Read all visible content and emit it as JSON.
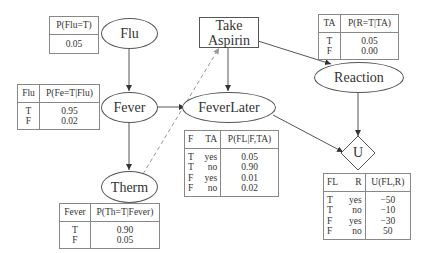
{
  "nodes": {
    "flu": {
      "label": "Flu",
      "shape": "ellipse"
    },
    "fever": {
      "label": "Fever",
      "shape": "ellipse"
    },
    "therm": {
      "label": "Therm",
      "shape": "ellipse"
    },
    "take_aspirin": {
      "label_line1": "Take",
      "label_line2": "Aspirin",
      "shape": "rectangle"
    },
    "fever_later": {
      "label": "FeverLater",
      "shape": "ellipse"
    },
    "reaction": {
      "label": "Reaction",
      "shape": "ellipse"
    },
    "utility": {
      "label": "U",
      "shape": "diamond"
    }
  },
  "edges": [
    {
      "from": "Flu",
      "to": "Fever",
      "style": "solid"
    },
    {
      "from": "Fever",
      "to": "FeverLater",
      "style": "solid"
    },
    {
      "from": "Fever",
      "to": "Therm",
      "style": "solid"
    },
    {
      "from": "Therm",
      "to": "Take Aspirin",
      "style": "dashed"
    },
    {
      "from": "Take Aspirin",
      "to": "FeverLater",
      "style": "solid"
    },
    {
      "from": "Take Aspirin",
      "to": "Reaction",
      "style": "solid"
    },
    {
      "from": "FeverLater",
      "to": "U",
      "style": "solid"
    },
    {
      "from": "Reaction",
      "to": "U",
      "style": "solid"
    }
  ],
  "tables": {
    "flu": {
      "header": [
        "P(Flu=T)"
      ],
      "rows": [
        [
          "0.05"
        ]
      ]
    },
    "fever": {
      "header": [
        "Flu",
        "P(Fe=T|Flu)"
      ],
      "rows": [
        [
          "T",
          "0.95"
        ],
        [
          "F",
          "0.02"
        ]
      ]
    },
    "therm": {
      "header": [
        "Fever",
        "P(Th=T|Fever)"
      ],
      "rows": [
        [
          "T",
          "0.90"
        ],
        [
          "F",
          "0.05"
        ]
      ]
    },
    "reaction": {
      "header": [
        "TA",
        "P(R=T|TA)"
      ],
      "rows": [
        [
          "T",
          "0.05"
        ],
        [
          "F",
          "0.00"
        ]
      ]
    },
    "fever_later": {
      "header": [
        "F",
        "TA",
        "P(FL|F,TA)"
      ],
      "rows": [
        [
          "T",
          "yes",
          "0.05"
        ],
        [
          "T",
          "no",
          "0.90"
        ],
        [
          "F",
          "yes",
          "0.01"
        ],
        [
          "F",
          "no",
          "0.02"
        ]
      ]
    },
    "utility": {
      "header": [
        "FL",
        "R",
        "U(FL,R)"
      ],
      "rows": [
        [
          "T",
          "yes",
          "−50"
        ],
        [
          "T",
          "no",
          "−10"
        ],
        [
          "F",
          "yes",
          "−30"
        ],
        [
          "F",
          "no",
          "50"
        ]
      ]
    }
  },
  "colors": {
    "line": "#555555",
    "dashed_line": "#999999",
    "background": "#ffffff"
  }
}
